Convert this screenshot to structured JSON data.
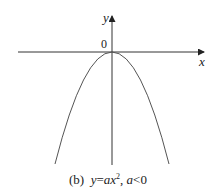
{
  "figure": {
    "axes": {
      "x_label": "x",
      "y_label": "y",
      "origin_label": "0"
    },
    "curve": {
      "equation": "y = ax^2",
      "condition": "a < 0",
      "shape": "downward-opening parabola with vertex at origin"
    },
    "caption": {
      "prefix": "(b)",
      "y": "y",
      "eq": "=",
      "a": "a",
      "x": "x",
      "exp": "2",
      "sep": ",",
      "a2": "a",
      "rel": "<",
      "zero": "0"
    },
    "colors": {
      "axis": "#333333",
      "curve": "#555555",
      "text": "#222222"
    }
  }
}
